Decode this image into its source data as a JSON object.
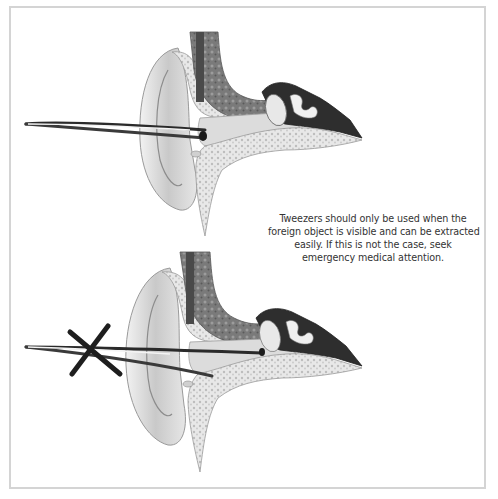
{
  "figure": {
    "border_color": "#d4d4d4",
    "panels": [
      {
        "id": "top",
        "depiction": "ear-cross-section",
        "tool": "tweezers",
        "tool_position": "outer-ear-canal",
        "marked_wrong": false
      },
      {
        "id": "bottom",
        "depiction": "ear-cross-section",
        "tool": "tweezers",
        "tool_position": "deep-in-ear-canal",
        "marked_wrong": true,
        "mark_icon": "x-mark-icon"
      }
    ],
    "caption": {
      "lines": [
        "Tweezers should only be used when the",
        "foreign object is visible and can be extracted",
        "easily. If this is not the case, seek",
        "emergency medical attention."
      ]
    }
  }
}
